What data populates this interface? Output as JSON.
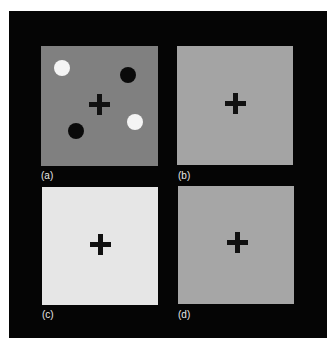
{
  "figure": {
    "frame_color": "#050505",
    "panels": [
      {
        "id": "a",
        "label": "(a)",
        "background": "#808080",
        "fixation": "+",
        "dots": [
          {
            "color": "white",
            "hex": "#f4f4f4"
          },
          {
            "color": "black",
            "hex": "#0a0a0a"
          },
          {
            "color": "white",
            "hex": "#f4f4f4"
          },
          {
            "color": "black",
            "hex": "#0a0a0a"
          }
        ]
      },
      {
        "id": "b",
        "label": "(b)",
        "background": "#a4a4a4",
        "fixation": "+"
      },
      {
        "id": "c",
        "label": "(c)",
        "background": "#e6e6e6",
        "fixation": "+"
      },
      {
        "id": "d",
        "label": "(d)",
        "background": "#a6a6a6",
        "fixation": "+"
      }
    ]
  }
}
